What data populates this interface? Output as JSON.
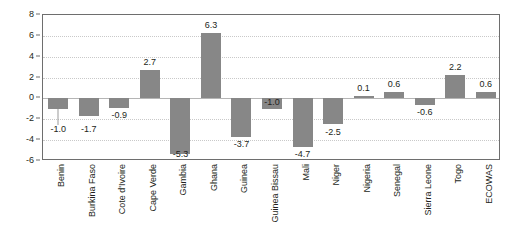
{
  "chart_data": {
    "type": "bar",
    "title": "",
    "subtitle": "",
    "xlabel": "",
    "ylabel": "",
    "ylim": [
      -6,
      8
    ],
    "ytick_values": [
      8,
      6,
      4,
      2,
      0,
      -2,
      -4,
      -6
    ],
    "ytick_labels": [
      "8",
      "6",
      "4",
      "2",
      "0",
      "-2",
      "-4",
      "-6"
    ],
    "grid": "horizontal-dotted",
    "legend": "none",
    "bar_color": "#878787",
    "categories": [
      "Benin",
      "Burkina Faso",
      "Cote d'Ivoire",
      "Cape Verde",
      "Gambia",
      "Ghana",
      "Guinea",
      "Guinea Bissau",
      "Mali",
      "Niger",
      "Nigeria",
      "Senegal",
      "Sierra Leone",
      "Togo",
      "ECOWAS"
    ],
    "values": [
      -1.0,
      -1.7,
      -0.9,
      2.7,
      -5.3,
      6.3,
      -3.7,
      -1.0,
      -4.7,
      -2.5,
      0.1,
      0.6,
      -0.6,
      2.2,
      0.6
    ],
    "value_labels": [
      "-1.0",
      "-1.7",
      "-0.9",
      "2.7",
      "-5.3",
      "6.3",
      "-3.7",
      "-1.0",
      "-4.7",
      "-2.5",
      "0.1",
      "0.6",
      "-0.6",
      "2.2",
      "0.6"
    ]
  }
}
